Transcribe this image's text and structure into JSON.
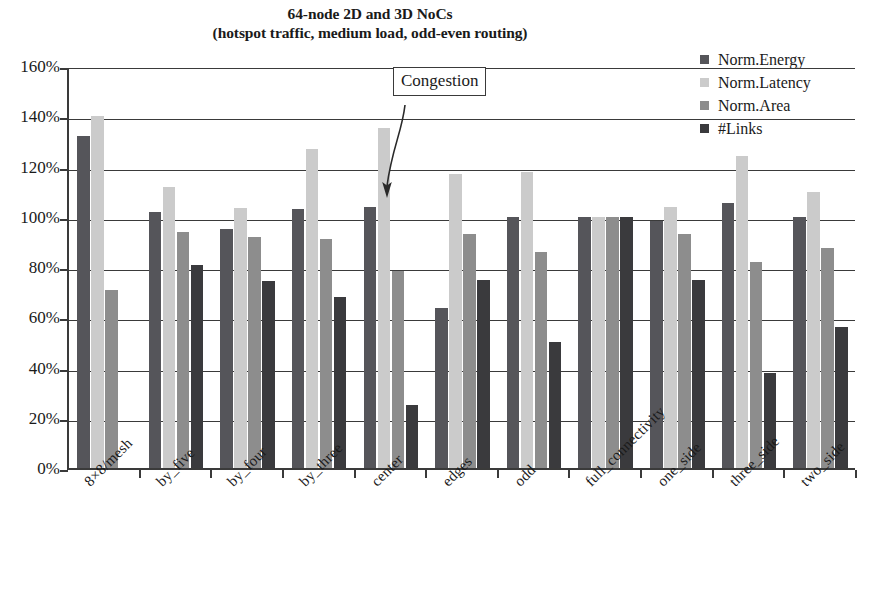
{
  "chart_data": {
    "type": "bar",
    "title": "64-node 2D and 3D NoCs",
    "subtitle": "(hotspot traffic, medium load, odd-even routing)",
    "xlabel": "",
    "ylabel": "",
    "ylim": [
      0,
      160
    ],
    "ytick_labels": [
      "160%",
      "140%",
      "120%",
      "100%",
      "80%",
      "60%",
      "40%",
      "20%",
      "0%"
    ],
    "ytick_values": [
      160,
      140,
      120,
      100,
      80,
      60,
      40,
      20,
      0
    ],
    "grid": true,
    "legend_position": "top-right",
    "categories": [
      "8×8/mesh",
      "by_five",
      "by_four",
      "by_three",
      "center",
      "edges",
      "odd",
      "full_connectivity",
      "one_side",
      "three_side",
      "two_side"
    ],
    "series": [
      {
        "name": "Norm.Energy",
        "color": "#55555a",
        "values": [
          132,
          102,
          95,
          103,
          104,
          63.5,
          100,
          100,
          98.5,
          105.5,
          100
        ]
      },
      {
        "name": "Norm.Latency",
        "color": "#cbcbcb",
        "values": [
          140,
          112,
          103.5,
          127,
          135.5,
          117,
          118,
          100,
          104,
          124,
          110
        ]
      },
      {
        "name": "Norm.Area",
        "color": "#8d8d8d",
        "values": [
          71,
          94,
          92,
          91,
          78.5,
          93,
          86,
          100,
          93,
          82,
          87.5
        ]
      },
      {
        "name": "#Links",
        "color": "#3a3a3d",
        "values": [
          null,
          81,
          74.5,
          68,
          25,
          75,
          50,
          100,
          75,
          38,
          56
        ]
      }
    ],
    "annotations": [
      {
        "text": "Congestion",
        "points_to_category": "center",
        "points_to_series": "Norm.Latency"
      }
    ]
  },
  "legend": {
    "items": [
      {
        "label": "Norm.Energy",
        "color": "#55555a"
      },
      {
        "label": "Norm.Latency",
        "color": "#cbcbcb"
      },
      {
        "label": "Norm.Area",
        "color": "#8d8d8d"
      },
      {
        "label": "#Links",
        "color": "#3a3a3d"
      }
    ]
  }
}
